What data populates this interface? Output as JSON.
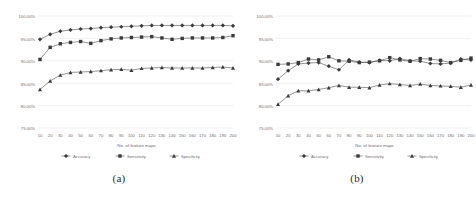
{
  "figure": {
    "subfigures": [
      {
        "caption": "(a)",
        "chart_index": 0
      },
      {
        "caption": "(b)",
        "chart_index": 1
      }
    ]
  },
  "chart_data": [
    {
      "type": "line",
      "title": "",
      "xlabel": "No. of feature maps",
      "ylabel": "",
      "x": [
        10,
        20,
        30,
        40,
        50,
        60,
        70,
        80,
        90,
        100,
        110,
        120,
        130,
        140,
        150,
        160,
        170,
        180,
        190,
        200
      ],
      "categories": [
        "10",
        "20",
        "30",
        "40",
        "50",
        "60",
        "70",
        "80",
        "90",
        "100",
        "110",
        "120",
        "130",
        "140",
        "150",
        "160",
        "170",
        "180",
        "190",
        "200"
      ],
      "ylim": [
        75,
        100
      ],
      "ytick_labels": [
        "100.00%",
        "95.00%",
        "90.00%",
        "85.00%",
        "80.00%",
        "75.00%"
      ],
      "ytick_values": [
        100,
        95,
        90,
        85,
        80,
        75
      ],
      "grid": true,
      "legend_position": "bottom",
      "series": [
        {
          "name": "Accuracy",
          "marker": "diamond",
          "color": "#3a3a3a",
          "values": [
            94.8,
            95.9,
            96.6,
            96.9,
            97.1,
            97.2,
            97.4,
            97.5,
            97.6,
            97.7,
            97.8,
            97.9,
            97.9,
            97.9,
            97.9,
            97.9,
            97.9,
            97.9,
            97.9,
            97.8
          ]
        },
        {
          "name": "Sensitivity",
          "marker": "square",
          "color": "#3a3a3a",
          "values": [
            90.3,
            93.0,
            93.8,
            94.1,
            94.3,
            93.9,
            94.5,
            94.9,
            95.1,
            95.2,
            95.3,
            95.4,
            95.1,
            94.8,
            95.0,
            95.1,
            95.1,
            95.1,
            95.2,
            95.6
          ]
        },
        {
          "name": "Specificity",
          "marker": "triangle",
          "color": "#3a3a3a",
          "values": [
            83.6,
            85.5,
            86.8,
            87.4,
            87.5,
            87.6,
            87.8,
            88.0,
            88.1,
            87.9,
            88.3,
            88.4,
            88.5,
            88.4,
            88.4,
            88.4,
            88.4,
            88.5,
            88.6,
            88.4
          ]
        }
      ]
    },
    {
      "type": "line",
      "title": "",
      "xlabel": "No. of feature maps",
      "ylabel": "",
      "x": [
        10,
        20,
        30,
        40,
        50,
        60,
        70,
        80,
        90,
        100,
        110,
        120,
        130,
        140,
        150,
        160,
        170,
        180,
        190,
        200
      ],
      "categories": [
        "10",
        "20",
        "30",
        "40",
        "50",
        "60",
        "70",
        "80",
        "90",
        "100",
        "110",
        "120",
        "130",
        "140",
        "150",
        "160",
        "170",
        "180",
        "190",
        "200"
      ],
      "ylim": [
        75,
        100
      ],
      "ytick_labels": [
        "100.00%",
        "95.00%",
        "90.00%",
        "85.00%",
        "80.00%",
        "75.00%"
      ],
      "ytick_values": [
        100,
        95,
        90,
        85,
        80,
        75
      ],
      "grid": true,
      "legend_position": "bottom",
      "series": [
        {
          "name": "Accuracy",
          "marker": "diamond",
          "color": "#3a3a3a",
          "values": [
            85.9,
            87.8,
            89.3,
            89.5,
            89.6,
            88.8,
            88.0,
            90.2,
            89.7,
            89.6,
            90.1,
            90.0,
            90.5,
            90.0,
            89.9,
            89.4,
            89.3,
            89.5,
            90.4,
            90.2
          ]
        },
        {
          "name": "Sensitivity",
          "marker": "square",
          "color": "#3a3a3a",
          "values": [
            89.2,
            89.3,
            89.6,
            90.4,
            90.2,
            90.9,
            90.0,
            89.9,
            89.6,
            89.7,
            90.0,
            90.7,
            90.2,
            89.9,
            90.5,
            90.4,
            90.1,
            89.6,
            90.1,
            90.6
          ]
        },
        {
          "name": "Specificity",
          "marker": "triangle",
          "color": "#3a3a3a",
          "values": [
            80.3,
            82.2,
            83.3,
            83.3,
            83.6,
            84.0,
            84.5,
            84.1,
            84.1,
            84.0,
            84.6,
            84.9,
            84.7,
            84.5,
            84.8,
            84.5,
            84.4,
            84.3,
            84.1,
            84.6
          ]
        }
      ]
    }
  ]
}
